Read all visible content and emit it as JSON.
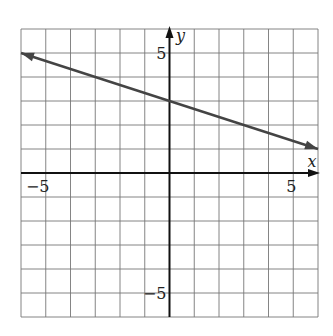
{
  "chart_data": {
    "type": "line",
    "title": "",
    "xlabel": "x",
    "ylabel": "y",
    "xlim": [
      -6,
      6
    ],
    "ylim": [
      -6,
      6
    ],
    "grid": true,
    "grid_step": 1,
    "tick_labels": {
      "x": [
        {
          "value": -5,
          "label": "−5"
        },
        {
          "value": 5,
          "label": "5"
        }
      ],
      "y": [
        {
          "value": 5,
          "label": "5"
        },
        {
          "value": -5,
          "label": "−5"
        }
      ]
    },
    "series": [
      {
        "name": "line",
        "equation": "y = -x/3 + 3",
        "slope": -0.3333,
        "intercept": 3,
        "x": [
          -6,
          0,
          6
        ],
        "y": [
          5,
          3,
          1
        ],
        "arrows_both_ends": true,
        "color": "#444444"
      }
    ]
  }
}
